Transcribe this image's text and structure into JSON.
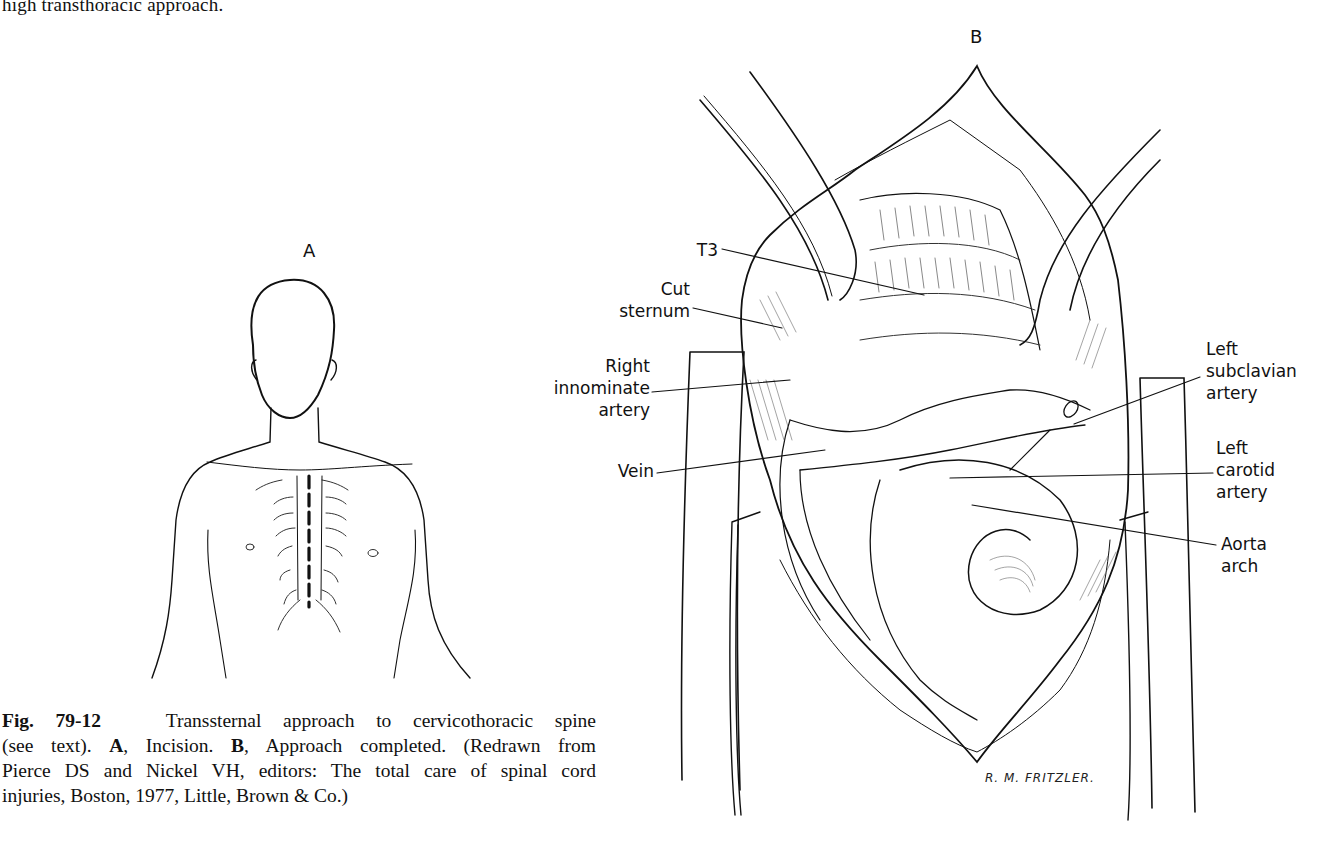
{
  "page": {
    "top_text": "high transthoracic approach."
  },
  "figure": {
    "number": "Fig. 79-12",
    "panels": {
      "A": {
        "letter": "A",
        "description": "Incision"
      },
      "B": {
        "letter": "B",
        "description": "Approach completed"
      }
    },
    "labels_B": {
      "t3": "T3",
      "cut_sternum": [
        "Cut",
        "sternum"
      ],
      "right_innominate_artery": [
        "Right",
        "innominate",
        "artery"
      ],
      "vein": "Vein",
      "left_subclavian_artery": [
        "Left",
        "subclavian",
        "artery"
      ],
      "left_carotid_artery": [
        "Left",
        "carotid",
        "artery"
      ],
      "aorta_arch": [
        "Aorta",
        "arch"
      ]
    },
    "signature": "R. M. FRITZLER.",
    "caption": {
      "lines": [
        {
          "bold": "Fig. 79-12",
          "text": "   Transsternal approach to cervicothoracic spine"
        },
        {
          "pre": "(see text). ",
          "boldA": "A",
          "mid": ", Incision. ",
          "boldB": "B",
          "post": ", Approach completed. (Redrawn from"
        },
        {
          "text": "Pierce DS and Nickel VH, editors: The total care of spinal cord"
        },
        {
          "text": "injuries, Boston, 1977, Little, Brown & Co.)"
        }
      ]
    }
  },
  "colors": {
    "ink": "#111111",
    "paper": "#ffffff"
  }
}
